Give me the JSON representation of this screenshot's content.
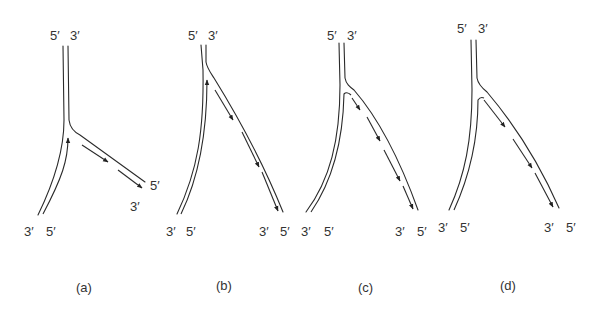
{
  "figure": {
    "panels": [
      {
        "caption": "(a)",
        "top_labels": [
          "5′",
          "3′"
        ],
        "left_bottom_labels": [
          "3′",
          "5′"
        ],
        "right_end_labels": [
          "5′",
          "3′"
        ],
        "leading_arrows": 1,
        "lagging_fragments": 2
      },
      {
        "caption": "(b)",
        "top_labels": [
          "5′",
          "3′"
        ],
        "left_bottom_labels": [
          "3′",
          "5′"
        ],
        "right_end_labels": [
          "3′",
          "5′"
        ],
        "leading_arrows": 1,
        "lagging_fragments": 2
      },
      {
        "caption": "(c)",
        "top_labels": [
          "5′",
          "3′"
        ],
        "left_bottom_labels": [
          "3′",
          "5′"
        ],
        "right_end_labels": [
          "3′",
          "5′"
        ],
        "leading_arrows": 0,
        "lagging_fragments": 3
      },
      {
        "caption": "(d)",
        "top_labels": [
          "5′",
          "3′"
        ],
        "left_bottom_labels": [
          "3′",
          "5′"
        ],
        "right_end_labels": [
          "3′",
          "5′"
        ],
        "leading_arrows": 0,
        "lagging_fragments": 3
      }
    ]
  }
}
